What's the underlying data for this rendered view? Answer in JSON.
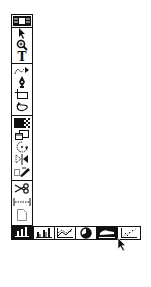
{
  "toolbar": {
    "tools": [
      {
        "name": "palette-header",
        "icon": "palette-header-icon"
      },
      {
        "name": "selection",
        "icon": "arrow-pointer-icon"
      },
      {
        "name": "zoom",
        "icon": "magnifier-icon"
      },
      {
        "name": "text",
        "icon": "text-icon",
        "glyph": "T"
      },
      {
        "name": "freehand",
        "icon": "freehand-path-icon"
      },
      {
        "name": "pen",
        "icon": "pen-nib-icon"
      },
      {
        "name": "rectangle",
        "icon": "rectangle-icon"
      },
      {
        "name": "lasso",
        "icon": "lasso-icon"
      },
      {
        "name": "pattern",
        "icon": "pattern-fill-icon"
      },
      {
        "name": "window",
        "icon": "window-icon"
      },
      {
        "name": "rotate",
        "icon": "rotate-icon"
      },
      {
        "name": "reflect",
        "icon": "reflect-icon"
      },
      {
        "name": "brush",
        "icon": "brush-icon"
      },
      {
        "name": "scissors",
        "icon": "scissors-icon"
      },
      {
        "name": "measure",
        "icon": "measure-icon"
      },
      {
        "name": "page",
        "icon": "page-icon"
      },
      {
        "name": "graph",
        "icon": "bar-graph-icon",
        "selected": true
      }
    ]
  },
  "graph_palette": {
    "options": [
      {
        "name": "grouped-column-graph",
        "icon": "grouped-column-graph-icon"
      },
      {
        "name": "line-graph",
        "icon": "line-graph-icon"
      },
      {
        "name": "pie-graph",
        "icon": "pie-graph-icon"
      },
      {
        "name": "area-graph",
        "icon": "area-graph-icon",
        "selected": true
      },
      {
        "name": "scatter-graph",
        "icon": "scatter-graph-icon"
      }
    ]
  },
  "colors": {
    "ink": "#111111",
    "background": "#ffffff"
  }
}
